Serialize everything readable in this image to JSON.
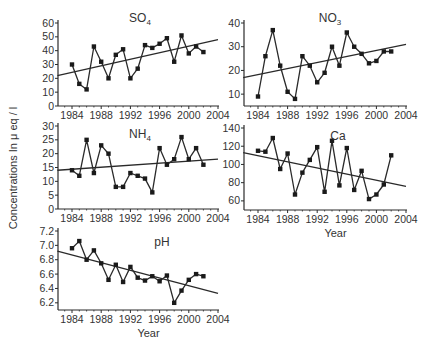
{
  "figure": {
    "ylabel": "Concentrations In μ eq / l",
    "xlabel": "Year"
  },
  "chart_data": [
    {
      "type": "line",
      "title": "SO4",
      "title_main": "SO",
      "title_sub": "4",
      "xlabel": "",
      "ylabel": "Concentrations In μ eq / l",
      "x": [
        1984,
        1985,
        1986,
        1987,
        1988,
        1989,
        1990,
        1991,
        1992,
        1993,
        1994,
        1995,
        1996,
        1997,
        1998,
        1999,
        2000,
        2001,
        2002
      ],
      "values": [
        30,
        16,
        12,
        43,
        32,
        20,
        37,
        41,
        20,
        27,
        44,
        42,
        45,
        49,
        32,
        51,
        38,
        43,
        39
      ],
      "trend": {
        "x": [
          1982,
          2004
        ],
        "y": [
          22,
          48
        ]
      },
      "xlim": [
        1982,
        2004
      ],
      "ylim": [
        0,
        60
      ],
      "xticks": [
        1984,
        1988,
        1992,
        1996,
        2000,
        2004
      ],
      "yticks": [
        0,
        10,
        20,
        30,
        40,
        50,
        60
      ],
      "grid": false,
      "legend": "none"
    },
    {
      "type": "line",
      "title": "NO3",
      "title_main": "NO",
      "title_sub": "3",
      "xlabel": "",
      "ylabel": "",
      "x": [
        1984,
        1985,
        1986,
        1987,
        1988,
        1989,
        1990,
        1991,
        1992,
        1993,
        1994,
        1995,
        1996,
        1997,
        1998,
        1999,
        2000,
        2001,
        2002
      ],
      "values": [
        9,
        26,
        37,
        22,
        11,
        8,
        26,
        22,
        15,
        19,
        30,
        22,
        36,
        30,
        27,
        23,
        24,
        28,
        28
      ],
      "trend": {
        "x": [
          1982,
          2004
        ],
        "y": [
          17,
          31
        ]
      },
      "xlim": [
        1982,
        2004
      ],
      "ylim": [
        5,
        40
      ],
      "xticks": [
        1984,
        1988,
        1992,
        1996,
        2000,
        2004
      ],
      "yticks": [
        10,
        20,
        30,
        40
      ],
      "grid": false,
      "legend": "none"
    },
    {
      "type": "line",
      "title": "NH4",
      "title_main": "NH",
      "title_sub": "4",
      "xlabel": "",
      "ylabel": "Concentrations In μ eq / l",
      "x": [
        1984,
        1985,
        1986,
        1987,
        1988,
        1989,
        1990,
        1991,
        1992,
        1993,
        1994,
        1995,
        1996,
        1997,
        1998,
        1999,
        2000,
        2001,
        2002
      ],
      "values": [
        14,
        12,
        25,
        13,
        23,
        20,
        8,
        8,
        13,
        12,
        11,
        6,
        22,
        16,
        18,
        26,
        18,
        22,
        16
      ],
      "trend": {
        "x": [
          1982,
          2004
        ],
        "y": [
          14,
          18
        ]
      },
      "xlim": [
        1982,
        2004
      ],
      "ylim": [
        0,
        30
      ],
      "xticks": [
        1984,
        1988,
        1992,
        1996,
        2000,
        2004
      ],
      "yticks": [
        0,
        5,
        10,
        15,
        20,
        25,
        30
      ],
      "grid": false,
      "legend": "none"
    },
    {
      "type": "line",
      "title": "Ca",
      "title_main": "Ca",
      "title_sub": "",
      "xlabel": "Year",
      "ylabel": "",
      "x": [
        1984,
        1985,
        1986,
        1987,
        1988,
        1989,
        1990,
        1991,
        1992,
        1993,
        1994,
        1995,
        1996,
        1997,
        1998,
        1999,
        2000,
        2001,
        2002
      ],
      "values": [
        115,
        114,
        129,
        95,
        112,
        67,
        91,
        105,
        119,
        70,
        126,
        77,
        118,
        72,
        93,
        62,
        67,
        78,
        110
      ],
      "trend": {
        "x": [
          1982,
          2004
        ],
        "y": [
          113,
          76
        ]
      },
      "xlim": [
        1982,
        2004
      ],
      "ylim": [
        50,
        140
      ],
      "xticks": [
        1984,
        1988,
        1992,
        1996,
        2000,
        2004
      ],
      "yticks": [
        60,
        80,
        100,
        120,
        140
      ],
      "grid": false,
      "legend": "none"
    },
    {
      "type": "line",
      "title": "pH",
      "title_main": "pH",
      "title_sub": "",
      "xlabel": "Year",
      "ylabel": "",
      "x": [
        1984,
        1985,
        1986,
        1987,
        1988,
        1989,
        1990,
        1991,
        1992,
        1993,
        1994,
        1995,
        1996,
        1997,
        1998,
        1999,
        2000,
        2001,
        2002
      ],
      "values": [
        6.96,
        7.06,
        6.8,
        6.93,
        6.75,
        6.52,
        6.73,
        6.49,
        6.7,
        6.55,
        6.51,
        6.57,
        6.5,
        6.58,
        6.2,
        6.37,
        6.52,
        6.6,
        6.57
      ],
      "trend": {
        "x": [
          1982,
          2004
        ],
        "y": [
          6.92,
          6.33
        ]
      },
      "xlim": [
        1982,
        2004
      ],
      "ylim": [
        6.1,
        7.2
      ],
      "xticks": [
        1984,
        1988,
        1992,
        1996,
        2000,
        2004
      ],
      "yticks": [
        6.2,
        6.4,
        6.6,
        6.8,
        7.0,
        7.2
      ],
      "ytick_labels": [
        "6.2",
        "6.4",
        "6.6",
        "6.8",
        "7.0",
        "7.2"
      ],
      "grid": false,
      "legend": "none"
    }
  ],
  "layout": {
    "panels": [
      {
        "left": 58,
        "right": 219,
        "top": 23,
        "bottom": 106,
        "title_x": 140,
        "title_y": 22,
        "show_xlabel": false
      },
      {
        "left": 244,
        "right": 407,
        "top": 23,
        "bottom": 106,
        "title_x": 330,
        "title_y": 22,
        "show_xlabel": false
      },
      {
        "left": 58,
        "right": 219,
        "top": 126,
        "bottom": 209,
        "title_x": 140,
        "title_y": 138,
        "show_xlabel": false
      },
      {
        "left": 244,
        "right": 407,
        "top": 128,
        "bottom": 210,
        "title_x": 338,
        "title_y": 140,
        "show_xlabel": true
      },
      {
        "left": 58,
        "right": 219,
        "top": 231,
        "bottom": 310,
        "title_x": 162,
        "title_y": 246,
        "show_xlabel": true
      }
    ],
    "line_color": "#2a2a2a",
    "marker_color": "#1a1a1a"
  }
}
